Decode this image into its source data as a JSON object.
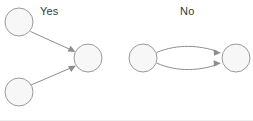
{
  "figure": {
    "kind": "directed-graph-comparison",
    "panels": [
      {
        "label": "Yes",
        "name": "panel-yes",
        "nodes": [
          {
            "id": "a",
            "name": "node-top-left",
            "cx": 19,
            "cy": 22,
            "r": 14
          },
          {
            "id": "b",
            "name": "node-middle",
            "cx": 88,
            "cy": 58,
            "r": 14
          },
          {
            "id": "c",
            "name": "node-bottom-left",
            "cx": 19,
            "cy": 92,
            "r": 14
          }
        ],
        "edges": [
          {
            "name": "edge-a-to-b",
            "from": "a",
            "to": "b",
            "style": "straight",
            "arrow": "forward"
          },
          {
            "name": "edge-c-to-b",
            "from": "c",
            "to": "b",
            "style": "straight",
            "arrow": "forward"
          }
        ]
      },
      {
        "label": "No",
        "name": "panel-no",
        "nodes": [
          {
            "id": "d",
            "name": "node-left",
            "cx": 143,
            "cy": 58,
            "r": 14
          },
          {
            "id": "e",
            "name": "node-right",
            "cx": 236,
            "cy": 58,
            "r": 14
          }
        ],
        "edges": [
          {
            "name": "edge-d-to-e-upper",
            "from": "d",
            "to": "e",
            "style": "curve-up",
            "arrow": "forward"
          },
          {
            "name": "edge-d-to-e-lower",
            "from": "d",
            "to": "e",
            "style": "curve-down",
            "arrow": "forward"
          }
        ]
      }
    ],
    "colors": {
      "node_fill": "#f7f7f7",
      "node_stroke": "#9a9a9a",
      "edge_stroke": "#8e8e8e",
      "label_text": "#3a3a3a",
      "background": "#ffffff"
    }
  }
}
